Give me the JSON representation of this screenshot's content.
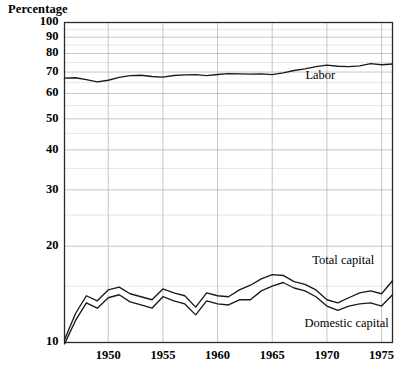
{
  "chart_data": {
    "type": "line",
    "title": "",
    "ylabel": "Percentage",
    "xlabel": "",
    "yscale": "log",
    "ylim": [
      10,
      100
    ],
    "xlim": [
      1946,
      1976
    ],
    "grid": true,
    "legend_position": "inline-annotations",
    "ytick_labels": [
      "100",
      "90",
      "80",
      "70",
      "60",
      "50",
      "40",
      "30",
      "20",
      "10"
    ],
    "ytick_values": [
      100,
      90,
      80,
      70,
      60,
      50,
      40,
      30,
      20,
      10
    ],
    "yminor_values": [
      95,
      85,
      75,
      65,
      55,
      45,
      35,
      25,
      15
    ],
    "xtick_labels": [
      "1950",
      "1955",
      "1960",
      "1965",
      "1970",
      "1975"
    ],
    "xtick_values": [
      1950,
      1955,
      1960,
      1965,
      1970,
      1975
    ],
    "x": [
      1946,
      1947,
      1948,
      1949,
      1950,
      1951,
      1952,
      1953,
      1954,
      1955,
      1956,
      1957,
      1958,
      1959,
      1960,
      1961,
      1962,
      1963,
      1964,
      1965,
      1966,
      1967,
      1968,
      1969,
      1970,
      1971,
      1972,
      1973,
      1974,
      1975,
      1976
    ],
    "series": [
      {
        "name": "Labor",
        "color": "#1a1a1a",
        "values": [
          67.0,
          67.2,
          66.3,
          65.2,
          66.0,
          67.4,
          68.2,
          68.4,
          67.8,
          67.5,
          68.3,
          68.6,
          68.7,
          68.2,
          68.8,
          69.2,
          69.1,
          69.0,
          69.1,
          68.7,
          69.6,
          70.8,
          71.6,
          72.8,
          73.6,
          73.0,
          72.8,
          73.2,
          74.4,
          73.8,
          74.2
        ]
      },
      {
        "name": "Total capital",
        "color": "#1a1a1a",
        "values": [
          10.2,
          12.3,
          14.0,
          13.5,
          14.6,
          14.9,
          14.2,
          13.9,
          13.6,
          14.7,
          14.3,
          14.0,
          12.9,
          14.3,
          14.0,
          13.9,
          14.6,
          15.1,
          15.8,
          16.3,
          16.2,
          15.5,
          15.2,
          14.6,
          13.6,
          13.3,
          13.8,
          14.3,
          14.5,
          14.2,
          15.6
        ]
      },
      {
        "name": "Domestic capital",
        "color": "#1a1a1a",
        "values": [
          9.9,
          11.7,
          13.3,
          12.8,
          13.8,
          14.1,
          13.4,
          13.1,
          12.8,
          13.9,
          13.5,
          13.2,
          12.2,
          13.5,
          13.2,
          13.1,
          13.6,
          13.6,
          14.5,
          15.0,
          15.4,
          14.8,
          14.5,
          13.9,
          13.0,
          12.6,
          13.0,
          13.2,
          13.3,
          13.0,
          14.1
        ]
      }
    ],
    "annotations": [
      {
        "text": "Labor",
        "x": 1969.4,
        "y": 66.5,
        "anchor": "middle"
      },
      {
        "text": "Total capital",
        "x": 1971.5,
        "y": 17.6,
        "anchor": "middle"
      },
      {
        "text": "Domestic capital",
        "x": 1971.8,
        "y": 11.2,
        "anchor": "middle"
      }
    ],
    "style": {
      "frame_color": "#2b2b2b",
      "major_grid_color": "#b9b9b9",
      "minor_grid_color": "#dcdcdc",
      "vgrid_color": "#b9b9b9",
      "background": "#ffffff",
      "line_width": 1.35
    }
  }
}
